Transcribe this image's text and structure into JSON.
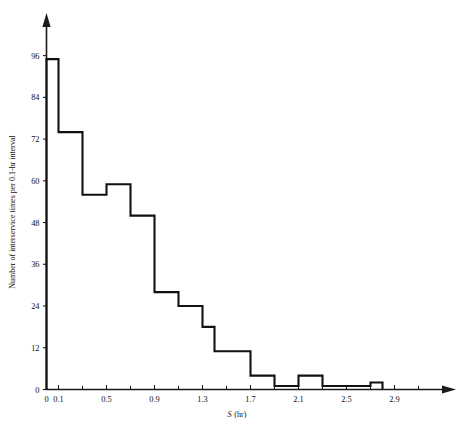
{
  "chart_data": {
    "type": "bar",
    "title": "",
    "subtitle": "",
    "xlabel": "S (hr)",
    "xlabel_symbol": "S",
    "xlabel_units": "(hr)",
    "ylabel": "Number of interservice times per 0.1-hr interval",
    "bin_width": 0.1,
    "xlim": [
      0,
      3.1
    ],
    "ylim": [
      0,
      100
    ],
    "xticks": [
      0,
      0.1,
      0.5,
      0.9,
      1.3,
      1.7,
      2.1,
      2.5,
      2.9
    ],
    "xtick_labels": [
      "0",
      "0.1",
      "0.5",
      "0.9",
      "1.3",
      "1.7",
      "2.1",
      "2.5",
      "2.9"
    ],
    "xticks_minor": [
      0.3,
      0.7,
      1.1,
      1.5,
      1.9,
      2.3,
      2.7,
      3.1
    ],
    "yticks": [
      0,
      12,
      24,
      36,
      48,
      60,
      72,
      84,
      96
    ],
    "ytick_labels": [
      "0",
      "12",
      "24",
      "36",
      "48",
      "60",
      "72",
      "84",
      "96"
    ],
    "grid": false,
    "legend": "none",
    "categories": [
      "0.0-0.1",
      "0.1-0.2",
      "0.2-0.3",
      "0.3-0.4",
      "0.4-0.5",
      "0.5-0.6",
      "0.6-0.7",
      "0.7-0.8",
      "0.8-0.9",
      "0.9-1.0",
      "1.0-1.1",
      "1.1-1.2",
      "1.2-1.3",
      "1.3-1.4",
      "1.4-1.5",
      "1.5-1.6",
      "1.6-1.7",
      "1.7-1.8",
      "1.8-1.9",
      "1.9-2.0",
      "2.0-2.1",
      "2.1-2.2",
      "2.2-2.3",
      "2.3-2.4",
      "2.4-2.5",
      "2.5-2.6",
      "2.6-2.7",
      "2.7-2.8"
    ],
    "bin_edges": [
      0.0,
      0.1,
      0.2,
      0.3,
      0.4,
      0.5,
      0.6,
      0.7,
      0.8,
      0.9,
      1.0,
      1.1,
      1.2,
      1.3,
      1.4,
      1.5,
      1.6,
      1.7,
      1.8,
      1.9,
      2.0,
      2.1,
      2.2,
      2.3,
      2.4,
      2.5,
      2.6,
      2.7,
      2.8
    ],
    "values": [
      95,
      74,
      74,
      56,
      56,
      59,
      59,
      50,
      50,
      28,
      28,
      24,
      24,
      18,
      11,
      11,
      11,
      4,
      4,
      1,
      1,
      4,
      4,
      1,
      1,
      1,
      1,
      2
    ],
    "series": [
      {
        "name": "Number of interservice times per 0.1-hr interval",
        "values": [
          95,
          74,
          74,
          56,
          56,
          59,
          59,
          50,
          50,
          28,
          28,
          24,
          24,
          18,
          11,
          11,
          11,
          4,
          4,
          1,
          1,
          4,
          4,
          1,
          1,
          1,
          1,
          2
        ]
      }
    ],
    "colors": {
      "outline": "#111111",
      "axis": "#1a1a1a",
      "background": "#ffffff"
    }
  }
}
